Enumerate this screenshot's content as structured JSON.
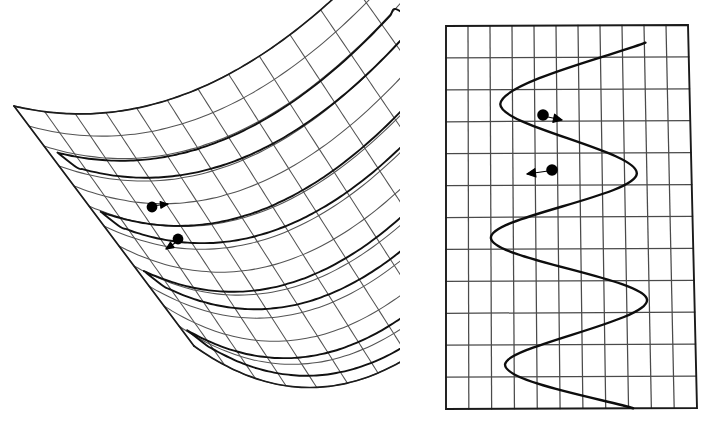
{
  "figure": {
    "width": 714,
    "height": 435,
    "background_color": "#ffffff",
    "ink_color": "#111111",
    "mesh_color": "#545454",
    "panels": [
      {
        "name": "surface-panel",
        "label": "3D parabolic trough surface",
        "x": 0,
        "y": 0,
        "width": 400,
        "height": 435
      },
      {
        "name": "grid-panel",
        "label": "2D grid with oscillating curve",
        "x": 400,
        "y": 0,
        "width": 314,
        "height": 435
      }
    ]
  },
  "surface": {
    "type": "parabolic-cylinder",
    "description": "Ruled trough surface drawn in oblique projection with a quadrilateral mesh",
    "corners": {
      "top_apex": [
        198,
        28
      ],
      "left_tip": [
        20,
        147
      ],
      "right_tip": [
        378,
        276
      ],
      "bottom": [
        252,
        420
      ]
    },
    "mesh": {
      "u_lines": 13,
      "v_lines": 13,
      "u_label": "ruling direction (straight generators)",
      "v_label": "parabolic cross-sections"
    },
    "projection": {
      "axis_u": [
        0.6,
        0.8
      ],
      "axis_v": [
        0.92,
        -0.39
      ],
      "depth_scale": 0.46
    },
    "cross_section_curves": [
      {
        "name": "parabola-1",
        "v_position": 0.16,
        "depth": 1.0
      },
      {
        "name": "parabola-2",
        "v_position": 0.4,
        "depth": 1.0
      },
      {
        "name": "parabola-3",
        "v_position": 0.64,
        "depth": 1.0
      },
      {
        "name": "parabola-4",
        "v_position": 0.88,
        "depth": 1.0
      }
    ],
    "markers": [
      {
        "name": "surface-point-upper",
        "x": 152,
        "y": 207,
        "radius": 5.4
      },
      {
        "name": "surface-point-lower",
        "x": 178,
        "y": 239,
        "radius": 5.4
      }
    ],
    "marker_arrows": [
      {
        "name": "surface-arrow-upper",
        "from": [
          152,
          206
        ],
        "to": [
          168,
          204
        ],
        "head": 4.2
      },
      {
        "name": "surface-arrow-lower",
        "from": [
          178,
          241
        ],
        "to": [
          166,
          249
        ],
        "head": 4.2
      }
    ]
  },
  "chart_data": {
    "type": "line",
    "title": "",
    "xlabel": "",
    "ylabel": "",
    "grid": true,
    "legend": null,
    "grid_frame": {
      "top_left": [
        446,
        26
      ],
      "top_right": [
        688,
        25
      ],
      "bottom_right": [
        697,
        408
      ],
      "bottom_left": [
        446,
        409
      ],
      "columns": 11,
      "rows": 12
    },
    "xlim": [
      0,
      11
    ],
    "ylim": [
      0,
      12
    ],
    "series": [
      {
        "name": "oscillating-wave",
        "orientation": "vertical-sinusoid",
        "amplitude_columns": 4.1,
        "center_column": 5.0,
        "cycles": 3.6,
        "phase_deg": 92,
        "points_x": [
          9.05,
          2.45,
          8.55,
          2.0,
          8.9,
          2.6,
          8.2
        ],
        "points_y": [
          0.55,
          2.45,
          4.65,
          6.65,
          8.6,
          10.6,
          12.0
        ]
      }
    ],
    "markers": [
      {
        "name": "wave-point-upper",
        "x": 543,
        "y": 115,
        "radius": 5.8,
        "grid_x": 4.4,
        "grid_y": 2.8,
        "direction": "right"
      },
      {
        "name": "wave-point-lower",
        "x": 552,
        "y": 170,
        "radius": 5.8,
        "grid_x": 4.8,
        "grid_y": 4.5,
        "direction": "left"
      }
    ],
    "marker_arrows": [
      {
        "name": "wave-arrow-right",
        "from": [
          548,
          117
        ],
        "to": [
          562,
          120
        ],
        "head": 5.0
      },
      {
        "name": "wave-arrow-left",
        "from": [
          548,
          171
        ],
        "to": [
          527,
          174
        ],
        "head": 5.0
      }
    ]
  }
}
